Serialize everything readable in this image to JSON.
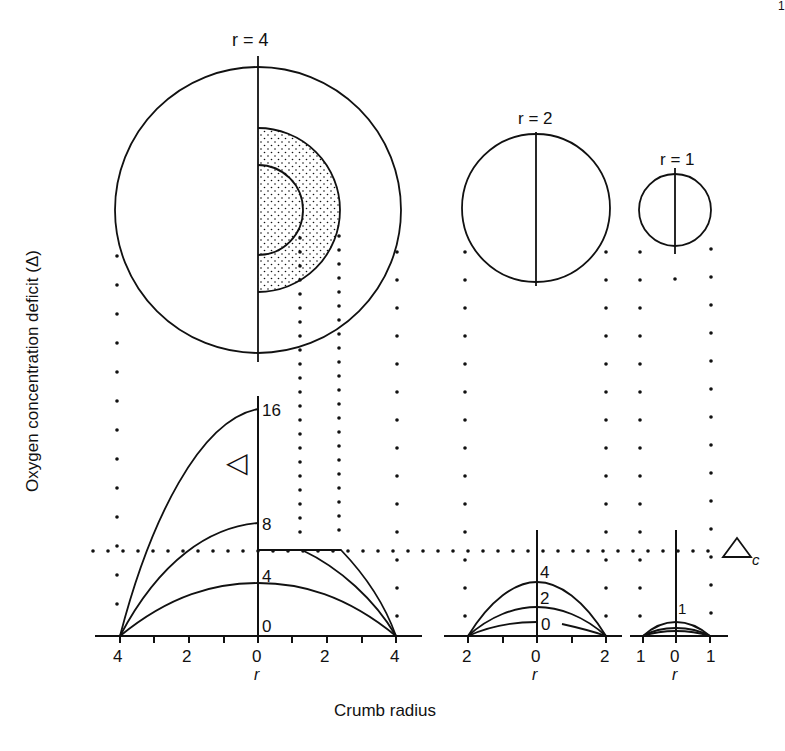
{
  "figure": {
    "page_mark": "1",
    "ylabel": "Oxygen concentration deficit (Δ)",
    "xlabel": "Crumb radius",
    "critical_label": "Δ",
    "critical_subscript": "c",
    "delta_symbol": "◁"
  },
  "crumbs": [
    {
      "label": "r = 4",
      "radius": 4,
      "note": "large crumb with dotted anaerobic zones (stippled half-annuli)"
    },
    {
      "label": "r = 2",
      "radius": 2
    },
    {
      "label": "r = 1",
      "radius": 1
    }
  ],
  "panels": [
    {
      "name": "r=4",
      "tick_labels": [
        "4",
        "2",
        "0",
        "2",
        "4"
      ],
      "axis_label": "r",
      "curve_labels": [
        "16",
        "8",
        "4",
        "0"
      ]
    },
    {
      "name": "r=2",
      "tick_labels": [
        "2",
        "0",
        "2"
      ],
      "axis_label": "r",
      "curve_labels": [
        "4",
        "2",
        "0"
      ]
    },
    {
      "name": "r=1",
      "tick_labels": [
        "1",
        "0",
        "1"
      ],
      "axis_label": "r",
      "curve_labels": [
        "1"
      ]
    }
  ],
  "chart_data": {
    "type": "line",
    "title": "",
    "xlabel": "Crumb radius",
    "ylabel": "Oxygen concentration deficit (Δ)",
    "critical_deficit": {
      "label": "Δc",
      "value": 6
    },
    "series": [
      {
        "panel": "r=4",
        "name": "peak 16",
        "x": [
          -4,
          -2,
          0
        ],
        "values": [
          0,
          12,
          16
        ]
      },
      {
        "panel": "r=4",
        "name": "peak 8",
        "x": [
          -4,
          -2,
          0
        ],
        "values": [
          0,
          6,
          8
        ]
      },
      {
        "panel": "r=4",
        "name": "peak 4",
        "x": [
          -4,
          -2,
          0,
          2,
          4
        ],
        "values": [
          0,
          3,
          4,
          3,
          0
        ]
      },
      {
        "panel": "r=4",
        "name": "capped at Δc (from 8)",
        "x": [
          0,
          1.3,
          4
        ],
        "values": [
          6,
          6,
          0
        ]
      },
      {
        "panel": "r=4",
        "name": "capped at Δc (from 16)",
        "x": [
          0,
          2.3,
          4
        ],
        "values": [
          6,
          6,
          0
        ]
      },
      {
        "panel": "r=2",
        "name": "peak 4",
        "x": [
          -2,
          0,
          2
        ],
        "values": [
          0,
          4,
          0
        ]
      },
      {
        "panel": "r=2",
        "name": "peak 2",
        "x": [
          -2,
          0,
          2
        ],
        "values": [
          0,
          2,
          0
        ]
      },
      {
        "panel": "r=2",
        "name": "peak 1",
        "x": [
          -2,
          0,
          2
        ],
        "values": [
          0,
          1,
          0
        ]
      },
      {
        "panel": "r=1",
        "name": "peak 1",
        "x": [
          -1,
          0,
          1
        ],
        "values": [
          0,
          1,
          0
        ]
      },
      {
        "panel": "r=1",
        "name": "peak 0.5",
        "x": [
          -1,
          0,
          1
        ],
        "values": [
          0,
          0.5,
          0
        ]
      },
      {
        "panel": "r=1",
        "name": "peak 0.25",
        "x": [
          -1,
          0,
          1
        ],
        "values": [
          0,
          0.25,
          0
        ]
      }
    ],
    "grid": false
  }
}
